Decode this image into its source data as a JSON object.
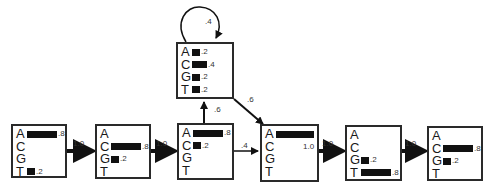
{
  "states": [
    {
      "id": "s1",
      "x": 11,
      "y": 124,
      "w": 56,
      "h": 54,
      "emissions": [
        {
          "base": "A",
          "p": 0.8,
          "label": ".8"
        },
        {
          "base": "C",
          "p": 0,
          "label": ""
        },
        {
          "base": "G",
          "p": 0,
          "label": ""
        },
        {
          "base": "T",
          "p": 0.2,
          "label": ".2"
        }
      ]
    },
    {
      "id": "s2",
      "x": 95,
      "y": 124,
      "w": 56,
      "h": 55,
      "emissions": [
        {
          "base": "A",
          "p": 0,
          "label": ""
        },
        {
          "base": "C",
          "p": 0.8,
          "label": ".8"
        },
        {
          "base": "G",
          "p": 0.2,
          "label": ".2"
        },
        {
          "base": "T",
          "p": 0,
          "label": ""
        }
      ]
    },
    {
      "id": "s3",
      "x": 177,
      "y": 123,
      "w": 57,
      "h": 57,
      "emissions": [
        {
          "base": "A",
          "p": 0.8,
          "label": ".8"
        },
        {
          "base": "C",
          "p": 0.2,
          "label": ".2"
        },
        {
          "base": "G",
          "p": 0,
          "label": ""
        },
        {
          "base": "T",
          "p": 0,
          "label": ""
        }
      ]
    },
    {
      "id": "insert",
      "x": 176,
      "y": 42,
      "w": 58,
      "h": 57,
      "emissions": [
        {
          "base": "A",
          "p": 0.2,
          "label": ".2"
        },
        {
          "base": "C",
          "p": 0.4,
          "label": ".4"
        },
        {
          "base": "G",
          "p": 0.2,
          "label": ".2"
        },
        {
          "base": "T",
          "p": 0.2,
          "label": ".2"
        }
      ]
    },
    {
      "id": "s4",
      "x": 260,
      "y": 124,
      "w": 59,
      "h": 58,
      "emissions": [
        {
          "base": "A",
          "p": 1.0,
          "label": "1.0"
        },
        {
          "base": "C",
          "p": 0,
          "label": ""
        },
        {
          "base": "G",
          "p": 0,
          "label": ""
        },
        {
          "base": "T",
          "p": 0,
          "label": ""
        }
      ]
    },
    {
      "id": "s5",
      "x": 345,
      "y": 125,
      "w": 57,
      "h": 56,
      "emissions": [
        {
          "base": "A",
          "p": 0,
          "label": ""
        },
        {
          "base": "C",
          "p": 0,
          "label": ""
        },
        {
          "base": "G",
          "p": 0.2,
          "label": ".2"
        },
        {
          "base": "T",
          "p": 0.8,
          "label": ".8"
        }
      ]
    },
    {
      "id": "s6",
      "x": 427,
      "y": 126,
      "w": 56,
      "h": 55,
      "emissions": [
        {
          "base": "A",
          "p": 0,
          "label": ""
        },
        {
          "base": "C",
          "p": 0.8,
          "label": ".8"
        },
        {
          "base": "G",
          "p": 0.2,
          "label": ".2"
        },
        {
          "base": "T",
          "p": 0,
          "label": ""
        }
      ]
    }
  ],
  "transitions": [
    {
      "from": "s1",
      "to": "s2",
      "p": "1.0"
    },
    {
      "from": "s2",
      "to": "s3",
      "p": "1.0"
    },
    {
      "from": "s3",
      "to": "insert",
      "p": ".6"
    },
    {
      "from": "s3",
      "to": "s4",
      "p": ".4"
    },
    {
      "from": "insert",
      "to": "insert",
      "p": ".4"
    },
    {
      "from": "insert",
      "to": "s4",
      "p": ".6"
    },
    {
      "from": "s4",
      "to": "s5",
      "p": "1.0"
    },
    {
      "from": "s5",
      "to": "s6",
      "p": "1.0"
    }
  ],
  "labels": {
    "t12": "1.0",
    "t23": "1.0",
    "t3i": ".6",
    "t34": ".4",
    "tii": ".4",
    "ti4": ".6",
    "t45": "1.0",
    "t56": "1.0"
  }
}
